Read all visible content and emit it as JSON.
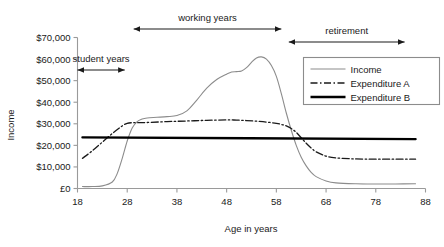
{
  "chart_data": {
    "type": "line",
    "title": "",
    "xlabel": "Age in years",
    "ylabel": "Income",
    "xlim": [
      18,
      88
    ],
    "ylim": [
      0,
      70000
    ],
    "xticks": [
      "18",
      "28",
      "38",
      "48",
      "58",
      "68",
      "78",
      "88"
    ],
    "xtick_values": [
      18,
      28,
      38,
      48,
      58,
      68,
      78,
      88
    ],
    "yticks": [
      "£0",
      "$10,000",
      "$20,000",
      "$30,000",
      "$40,000",
      "$50,000",
      "$60,000",
      "$70,000"
    ],
    "ytick_values": [
      0,
      10000,
      20000,
      30000,
      40000,
      50000,
      60000,
      70000
    ],
    "grid": false,
    "legend_position": "upper right",
    "series": [
      {
        "name": "Income",
        "style": "solid-thin",
        "color": "#8c8c8c",
        "x": [
          19,
          21,
          23,
          25,
          26,
          27,
          28,
          29,
          30,
          31,
          32,
          34,
          36,
          38,
          40,
          42,
          44,
          46,
          48,
          49,
          50,
          51,
          52,
          53,
          54,
          55,
          56,
          57,
          58,
          59,
          60,
          61,
          62,
          63,
          64,
          65,
          66,
          68,
          70,
          74,
          78,
          82,
          86
        ],
        "y": [
          900,
          900,
          1200,
          3000,
          7000,
          14000,
          22000,
          28000,
          31000,
          32200,
          32700,
          33000,
          33300,
          33800,
          36000,
          41000,
          46500,
          50500,
          53000,
          54000,
          54200,
          54500,
          56000,
          58500,
          60500,
          61000,
          60000,
          57000,
          52000,
          44000,
          35000,
          27000,
          20000,
          14500,
          10500,
          7500,
          5500,
          3500,
          2600,
          2200,
          2100,
          2100,
          2200
        ]
      },
      {
        "name": "Expenditure A",
        "style": "dash-dot",
        "color": "#1a1a1a",
        "x": [
          19,
          21,
          23,
          25,
          27,
          28,
          29,
          30,
          32,
          36,
          40,
          44,
          48,
          50,
          52,
          54,
          56,
          58,
          59,
          60,
          61,
          62,
          63,
          64,
          65,
          66,
          68,
          70,
          74,
          78,
          82,
          86
        ],
        "y": [
          14000,
          17500,
          21500,
          25500,
          29000,
          30200,
          30500,
          30500,
          30600,
          31000,
          31300,
          31600,
          31800,
          31700,
          31500,
          31200,
          30800,
          30200,
          29700,
          29000,
          27800,
          26000,
          23500,
          21000,
          18800,
          17000,
          15000,
          14200,
          13700,
          13600,
          13600,
          13600
        ]
      },
      {
        "name": "Expenditure B",
        "style": "solid-thick",
        "color": "#000000",
        "x": [
          19,
          86
        ],
        "y": [
          23700,
          22900
        ]
      }
    ],
    "annotations": [
      {
        "label": "student years",
        "x_start": 18,
        "x_end": 27.5,
        "y_px": 70,
        "label_y_px": 62
      },
      {
        "label": "working years",
        "x_start": 29.3,
        "x_end": 59.0,
        "y_px": 29,
        "label_y_px": 21
      },
      {
        "label": "retirement",
        "x_start": 60.5,
        "x_end": 83.8,
        "y_px": 42,
        "label_y_px": 34
      }
    ]
  }
}
